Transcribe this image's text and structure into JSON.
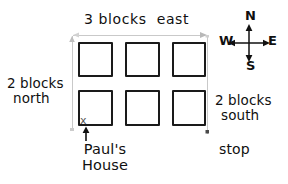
{
  "diagram": {
    "title_top": "3 blocks  east",
    "label_left_line1": "2 blocks",
    "label_left_line2": "north",
    "label_right_line1": "2 blocks",
    "label_right_line2": "south",
    "label_stop": "stop",
    "label_house_line1": "Paul's",
    "label_house_line2": "House",
    "marker_x": "x"
  },
  "compass": {
    "north": "N",
    "south": "S",
    "west": "W",
    "east": "E"
  },
  "colors": {
    "ink": "#1a1a1a",
    "guide": "#c9c9c9",
    "paper": "#ffffff",
    "marker": "#555555"
  },
  "grid": {
    "rows": 2,
    "cols": 3,
    "blocks": [
      {
        "name": "block-r1c1",
        "x": 78,
        "y": 42,
        "w": 35,
        "h": 35
      },
      {
        "name": "block-r1c2",
        "x": 125,
        "y": 42,
        "w": 35,
        "h": 35
      },
      {
        "name": "block-r1c3",
        "x": 172,
        "y": 42,
        "w": 34,
        "h": 35
      },
      {
        "name": "block-r2c1",
        "x": 78,
        "y": 90,
        "w": 35,
        "h": 36
      },
      {
        "name": "block-r2c2",
        "x": 125,
        "y": 90,
        "w": 35,
        "h": 36
      },
      {
        "name": "block-r2c3",
        "x": 172,
        "y": 90,
        "w": 34,
        "h": 36
      }
    ]
  }
}
